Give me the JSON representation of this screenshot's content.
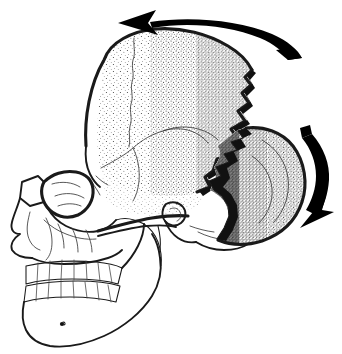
{
  "figure": {
    "title": "Lateral view of human skull with detached occipital segment",
    "background_color": "#ffffff",
    "ink_color": "#000000",
    "width_px": 342,
    "height_px": 354,
    "has_text_labels": false,
    "caption": "",
    "style": "black-and-white stipple line drawing"
  },
  "anatomy": {
    "parts": [
      {
        "id": "frontal-bone",
        "label": "Frontal bone",
        "shading": "none"
      },
      {
        "id": "parietal-bone",
        "label": "Parietal bone",
        "shading": "stipple"
      },
      {
        "id": "temporal-bone",
        "label": "Temporal bone",
        "shading": "none"
      },
      {
        "id": "sphenoid-bone",
        "label": "Sphenoid bone",
        "shading": "none"
      },
      {
        "id": "occipital-fragment",
        "label": "Detached occipital segment",
        "shading": "stipple-dark"
      },
      {
        "id": "zygomatic-arch",
        "label": "Zygomatic arch",
        "shading": "none"
      },
      {
        "id": "orbit",
        "label": "Orbit",
        "shading": "none"
      },
      {
        "id": "nasal-aperture",
        "label": "Nasal aperture",
        "shading": "none"
      },
      {
        "id": "maxilla",
        "label": "Maxilla",
        "shading": "none"
      },
      {
        "id": "mandible",
        "label": "Mandible",
        "shading": "none"
      },
      {
        "id": "upper-teeth",
        "label": "Upper dental arcade",
        "shading": "none"
      },
      {
        "id": "lower-teeth",
        "label": "Lower dental arcade",
        "shading": "none"
      },
      {
        "id": "mental-foramen",
        "label": "Mental foramen",
        "shading": "solid"
      },
      {
        "id": "external-auditory-meatus",
        "label": "External auditory meatus",
        "shading": "none"
      },
      {
        "id": "mastoid-process",
        "label": "Mastoid process",
        "shading": "none"
      },
      {
        "id": "lambdoid-suture",
        "label": "Lambdoid suture (separation edge)",
        "shading": "dark"
      },
      {
        "id": "coronal-suture",
        "label": "Coronal suture",
        "shading": "none"
      },
      {
        "id": "squamosal-suture",
        "label": "Squamosal suture",
        "shading": "none"
      }
    ]
  },
  "annotations": {
    "arrows": [
      {
        "id": "arrow-cranial-rotation",
        "label": "Cranial rotation arrow",
        "direction": "left",
        "position": "above-cranium",
        "head_position": "left-end",
        "color": "#000000",
        "shape": "tapered-curved-band"
      },
      {
        "id": "arrow-occipital-rotation",
        "label": "Occipital segment rotation arrow",
        "direction": "down",
        "position": "right-of-occipital-fragment",
        "head_position": "bottom-end",
        "color": "#000000",
        "shape": "tapered-curved-band"
      }
    ]
  }
}
